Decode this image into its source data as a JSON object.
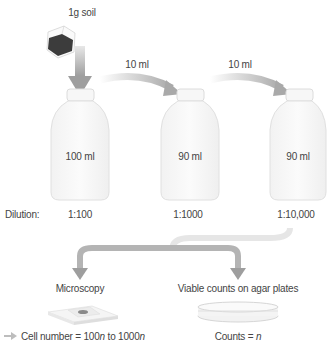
{
  "source": {
    "label": "1g soil"
  },
  "transfers": [
    {
      "label": "10 ml"
    },
    {
      "label": "10 ml"
    }
  ],
  "bottles": [
    {
      "volume": "100 ml",
      "dilution": "1:100"
    },
    {
      "volume": "90 ml",
      "dilution": "1:1000"
    },
    {
      "volume": "90 ml",
      "dilution": "1:10,000"
    }
  ],
  "dilution_label": "Dilution:",
  "methods": [
    {
      "label": "Microscopy",
      "result_prefix": "Cell number = 100",
      "result_var1": "n",
      "result_mid": " to 1000",
      "result_var2": "n"
    },
    {
      "label": "Viable counts on agar plates",
      "result_prefix": "Counts = ",
      "result_var": "n"
    }
  ],
  "colors": {
    "arrow": "#a9a9a9",
    "bottle_fill": "#f7f7f7",
    "bottle_stroke": "#dcdcdc",
    "soil": "#3c3c3c",
    "text": "#444444"
  }
}
